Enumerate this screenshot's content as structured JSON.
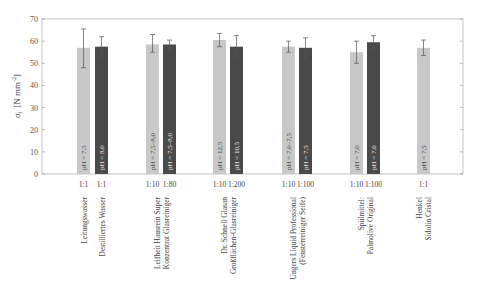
{
  "chart_data": {
    "type": "bar",
    "title": "",
    "xlabel": "",
    "ylabel": "σt [N mm⁻²]",
    "ylabel_symbol": "σ",
    "ylabel_sub": "t",
    "ylabel_unit": "[N mm",
    "ylabel_exp": "-2",
    "ylabel_close": "]",
    "ylim": [
      0,
      70
    ],
    "yticks": [
      0,
      10,
      20,
      30,
      40,
      50,
      60,
      70
    ],
    "grid": false,
    "legend": null,
    "colors": {
      "light": "#c8c8c8",
      "dark": "#4a4a4a"
    },
    "groups": [
      {
        "category": [
          "Leitungswasser"
        ],
        "bars": [
          {
            "dilution": "1:1",
            "value": 57,
            "err_low": 48,
            "err_high": 65.5,
            "ph": "pH = 7,5",
            "shade": "light"
          }
        ]
      },
      {
        "category": [
          "Destilliertes Wasser"
        ],
        "bars": [
          {
            "dilution": "1:1",
            "value": 57.5,
            "err_low": 53,
            "err_high": 62,
            "ph": "pH = 8,0",
            "shade": "dark"
          }
        ]
      },
      {
        "category": [
          "Leifheit Hausrein Super",
          "Konzentrat Glasreiniger"
        ],
        "bars": [
          {
            "dilution": "1:10",
            "value": 58.5,
            "err_low": 55,
            "err_high": 63,
            "ph": "pH = 7,5–8,0",
            "shade": "light"
          },
          {
            "dilution": "1:80",
            "value": 58.5,
            "err_low": 56,
            "err_high": 60.5,
            "ph": "pH = 7,5–8,0",
            "shade": "dark"
          }
        ]
      },
      {
        "category": [
          "Dr. Schnell Glasan",
          "Großflächen-Glasreiniger"
        ],
        "bars": [
          {
            "dilution": "1:10",
            "value": 60.5,
            "err_low": 57.5,
            "err_high": 63.5,
            "ph": "pH = 12,5",
            "shade": "light"
          },
          {
            "dilution": "1:200",
            "value": 57.5,
            "err_low": 52.5,
            "err_high": 62.5,
            "ph": "pH = 10,5",
            "shade": "dark"
          }
        ]
      },
      {
        "category": [
          "Ungers Liquid Professional",
          "(Fensterreiniger Seife)"
        ],
        "bars": [
          {
            "dilution": "1:10",
            "value": 57.5,
            "err_low": 55,
            "err_high": 60,
            "ph": "pH = 7,0–7,5",
            "shade": "light"
          },
          {
            "dilution": "1:100",
            "value": 57,
            "err_low": 52,
            "err_high": 61.5,
            "ph": "pH = 7,5",
            "shade": "dark"
          }
        ]
      },
      {
        "category": [
          "Spülmittel:",
          "Palmolive Original"
        ],
        "bars": [
          {
            "dilution": "1:10",
            "value": 55,
            "err_low": 50,
            "err_high": 60,
            "ph": "pH = 7,0",
            "shade": "light"
          },
          {
            "dilution": "1:100",
            "value": 59.5,
            "err_low": 56.5,
            "err_high": 62.5,
            "ph": "pH = 7,0",
            "shade": "dark"
          }
        ]
      },
      {
        "category": [
          "Henkel",
          "Sidolin Cristal"
        ],
        "bars": [
          {
            "dilution": "1:1",
            "value": 57,
            "err_low": 53.5,
            "err_high": 60.5,
            "ph": "pH = 7,5",
            "shade": "light"
          }
        ]
      }
    ]
  }
}
